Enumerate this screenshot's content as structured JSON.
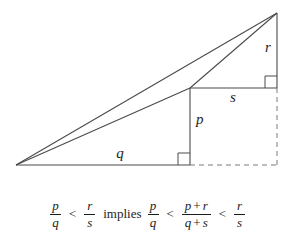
{
  "figure": {
    "background_color": "#ffffff",
    "stroke_color": "#4a4a4a",
    "text_color": "#1c1c1c"
  },
  "diagram": {
    "labels": {
      "q": "q",
      "p": "p",
      "s": "s",
      "r": "r"
    },
    "vertices": {
      "origin": [
        16,
        165
      ],
      "apex": [
        277,
        13
      ],
      "junction": [
        190,
        88
      ],
      "base_right": [
        190,
        165
      ],
      "far_right_base": [
        277,
        165
      ],
      "s_right": [
        277,
        88
      ]
    },
    "right_angle_markers": [
      {
        "name": "base-right-angle",
        "x": 178,
        "y": 153
      },
      {
        "name": "upper-right-angle",
        "x": 265,
        "y": 76
      }
    ]
  },
  "formula": {
    "lhs": {
      "numerator": "p",
      "denominator": "q"
    },
    "rel1": "<",
    "rs": {
      "numerator": "r",
      "denominator": "s"
    },
    "implies": "implies",
    "pq2": {
      "numerator": "p",
      "denominator": "q"
    },
    "rel2": "<",
    "mediant": {
      "num_left": "p",
      "num_plus": "+",
      "num_right": "r",
      "den_left": "q",
      "den_plus": "+",
      "den_right": "s"
    },
    "rel3": "<",
    "rs2": {
      "numerator": "r",
      "denominator": "s"
    }
  }
}
